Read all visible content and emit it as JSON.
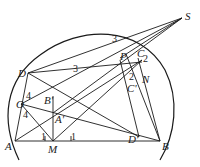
{
  "diagram": {
    "type": "geometry",
    "points": {
      "S": {
        "label": "S",
        "x": 182,
        "y": 18
      },
      "P": {
        "label": "P",
        "x": 128,
        "y": 54
      },
      "C": {
        "label": "C",
        "x": 140,
        "y": 58
      },
      "N": {
        "label": "N",
        "x": 143,
        "y": 78
      },
      "D": {
        "label": "D",
        "x": 28,
        "y": 73
      },
      "Cp": {
        "label": "C'",
        "x": 126,
        "y": 84
      },
      "Bp": {
        "label": "B'",
        "x": 53,
        "y": 98
      },
      "O": {
        "label": "O",
        "x": 21,
        "y": 104
      },
      "Ap": {
        "label": "A'",
        "x": 53,
        "y": 113
      },
      "A": {
        "label": "A",
        "x": 15,
        "y": 141
      },
      "M": {
        "label": "M",
        "x": 53,
        "y": 141
      },
      "Dp": {
        "label": "D'",
        "x": 139,
        "y": 137
      },
      "B": {
        "label": "B",
        "x": 160,
        "y": 141
      }
    },
    "angle_marks": {
      "top3": "3",
      "left3": "3",
      "right2a": "2",
      "right2b": "2",
      "upper4": "4",
      "lower4": "4",
      "leftTick1": "1",
      "rightTick1": "1"
    },
    "stroke_color": "#1a1a1a",
    "background": "#ffffff"
  }
}
